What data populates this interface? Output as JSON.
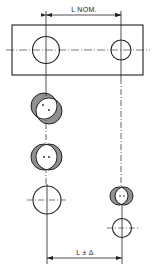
{
  "diagram": {
    "type": "technical-drawing",
    "colors": {
      "ink": "#222222",
      "background": "#ffffff"
    },
    "dimensions": {
      "top_label": "L NOM.",
      "bottom_label": "L ± Δ"
    },
    "views": [
      {
        "name": "plate-with-two-holes",
        "description": "Rectangular plate with larger left hole and smaller right hole on common centerline"
      },
      {
        "name": "offset-misaligned-holes",
        "description": "Hatched overlap of left hole, offset diagonally"
      },
      {
        "name": "lateral-misaligned-holes",
        "description": "Hatched overlap of left hole, offset horizontally"
      },
      {
        "name": "aligned-left-hole",
        "description": "Plain left hole with crosshair centerlines"
      },
      {
        "name": "right-hole-misaligned",
        "description": "Hatched overlap of right hole"
      },
      {
        "name": "aligned-right-hole",
        "description": "Plain right hole with crosshair centerlines"
      }
    ]
  }
}
